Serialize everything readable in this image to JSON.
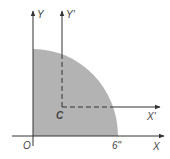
{
  "diagram": {
    "title": "",
    "shape": "quarter-circle",
    "fill_color": "#b3b3b3",
    "axis_color": "#333333",
    "labels": {
      "origin": "O",
      "x_axis": "X",
      "y_axis": "Y",
      "centroid": "C",
      "x_prime": "X'",
      "y_prime": "Y'",
      "radius": "6\""
    }
  }
}
